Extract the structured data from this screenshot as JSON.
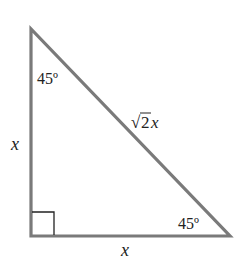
{
  "figure": {
    "type": "45-45-90 right triangle",
    "colors": {
      "triangle_stroke": "#7a7a7a",
      "right_angle_marker": "#222222",
      "text": "#222222",
      "background": "#ffffff"
    },
    "angles": {
      "top": "45º",
      "bottom_right": "45º"
    },
    "sides": {
      "left_leg": "x",
      "bottom_leg": "x",
      "hypotenuse_radical": "√",
      "hypotenuse_radicand": "2",
      "hypotenuse_variable": "x"
    }
  }
}
